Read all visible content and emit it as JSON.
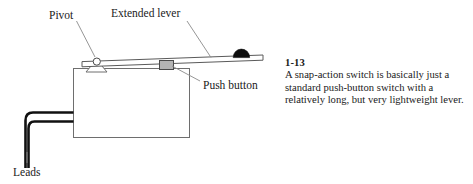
{
  "figure": {
    "caption_number": "1-13",
    "caption_text": "A snap-action switch is basically just a standard push-button switch with a relatively long, but very lightweight lever.",
    "labels": {
      "pivot": "Pivot",
      "extended_lever": "Extended lever",
      "push_button": "Push button",
      "leads": "Leads"
    },
    "colors": {
      "background": "#ffffff",
      "outline": "#3c3c3c",
      "lever_fill": "#ffffff",
      "push_button_fill": "#b4b4b4",
      "ball_fill": "#0d0d0d",
      "lead_stroke": "#111111",
      "text": "#1a1a1a",
      "leader_line": "#8a8a8a"
    }
  }
}
